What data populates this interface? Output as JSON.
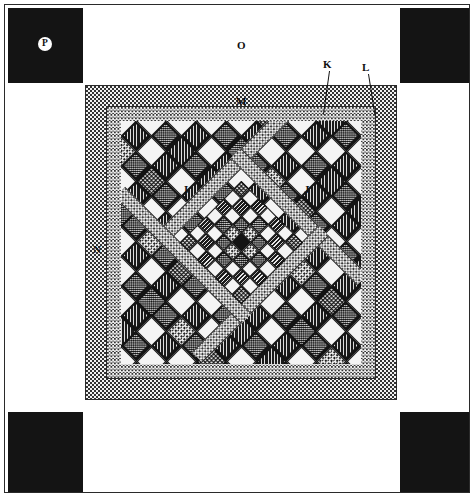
{
  "figure": {
    "type": "quilt-block-diagram"
  },
  "labels": [
    {
      "id": "P",
      "text": "P",
      "x": 41,
      "y": 41,
      "style": "circle-on-black",
      "target": "corner-square"
    },
    {
      "id": "O",
      "text": "O",
      "x": 240,
      "y": 43,
      "style": "plain",
      "target": "outer-white-border"
    },
    {
      "id": "K",
      "text": "K",
      "x": 326,
      "y": 64,
      "style": "leader",
      "target": "lattice-triangle",
      "leader": {
        "x1": 328,
        "y1": 72,
        "x2": 322,
        "y2": 113
      }
    },
    {
      "id": "L",
      "text": "L",
      "x": 364,
      "y": 66,
      "style": "leader",
      "target": "inner-border-strip",
      "leader": {
        "x1": 366,
        "y1": 74,
        "x2": 372,
        "y2": 112
      }
    },
    {
      "id": "M",
      "text": "M",
      "x": 239,
      "y": 100,
      "style": "plain",
      "target": "inner-stipple-border"
    },
    {
      "id": "N",
      "text": "N",
      "x": 96,
      "y": 248,
      "style": "plain",
      "target": "outer-stipple-border"
    },
    {
      "id": "I",
      "text": "I",
      "x": 186,
      "y": 188,
      "style": "plain",
      "target": "diagonal-sashing"
    },
    {
      "id": "J",
      "text": "J",
      "x": 306,
      "y": 188,
      "style": "plain",
      "target": "diagonal-sashing"
    }
  ],
  "colors": {
    "ink": "#141414",
    "paper": "#ffffff",
    "light_fabric": "#f4f4f4",
    "stipple_bg": "#f0f0f0"
  },
  "geometry": {
    "frame": {
      "x": 4,
      "y": 4,
      "w": 466,
      "h": 489
    },
    "corner_squares": [
      {
        "name": "top-left",
        "x": 8,
        "y": 8,
        "w": 75,
        "h": 75
      },
      {
        "name": "top-right",
        "x": 399,
        "y": 8,
        "w": 70,
        "h": 75
      },
      {
        "name": "bottom-left",
        "x": 8,
        "y": 412,
        "w": 75,
        "h": 80
      },
      {
        "name": "bottom-right",
        "x": 399,
        "y": 412,
        "w": 70,
        "h": 80
      }
    ],
    "outer_band": {
      "x": 85,
      "y": 85,
      "w": 311,
      "h": 314,
      "label": "N"
    },
    "inner_band": {
      "x": 106,
      "y": 106,
      "w": 268,
      "h": 272,
      "label": "M"
    },
    "quilt": {
      "x": 121,
      "y": 121,
      "w": 238,
      "h": 242
    }
  },
  "structure": {
    "center_grid": {
      "rows": 7,
      "cols": 7,
      "rotated_deg": 45
    },
    "lattice": {
      "type": "on-point-diamonds",
      "per_side": 7
    },
    "sashing": {
      "shape": "diamond-frame",
      "fill": "stipple"
    }
  },
  "center_cells": [
    [
      "f-dot",
      "f-white",
      "f-vstripe",
      "f-white",
      "f-vstripe",
      "f-white",
      "f-dot"
    ],
    [
      "f-white",
      "f-vstripe",
      "f-white",
      "f-check",
      "f-white",
      "f-vstripe",
      "f-white"
    ],
    [
      "f-vstripe",
      "f-white",
      "f-check",
      "f-speck",
      "f-check",
      "f-white",
      "f-vstripe"
    ],
    [
      "f-white",
      "f-check",
      "f-speck",
      "f-black",
      "f-speck",
      "f-check",
      "f-white"
    ],
    [
      "f-vstripe",
      "f-white",
      "f-check",
      "f-speck",
      "f-check",
      "f-white",
      "f-vstripe"
    ],
    [
      "f-white",
      "f-vstripe",
      "f-white",
      "f-check",
      "f-white",
      "f-vstripe",
      "f-white"
    ],
    [
      "f-dot",
      "f-white",
      "f-vstripe",
      "f-white",
      "f-vstripe",
      "f-white",
      "f-dot"
    ]
  ],
  "lattice_fills": [
    "f-diag",
    "f-white",
    "f-check",
    "f-speck",
    "f-dot",
    "f-white",
    "f-diag"
  ]
}
